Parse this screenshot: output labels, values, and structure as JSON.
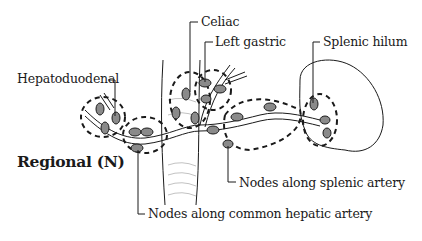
{
  "diagram": {
    "region_label": "Regional (N)",
    "labels": {
      "celiac": "Celiac",
      "left_gastric": "Left gastric",
      "splenic_hilum": "Splenic hilum",
      "hepatoduodenal": "Hepatoduodenal",
      "splenic_artery": "Nodes along splenic artery",
      "common_hepatic_artery": "Nodes along common hepatic artery"
    },
    "colors": {
      "line": "#1a1a1a",
      "node_fill": "#8a8a8a",
      "background": "#ffffff"
    }
  }
}
